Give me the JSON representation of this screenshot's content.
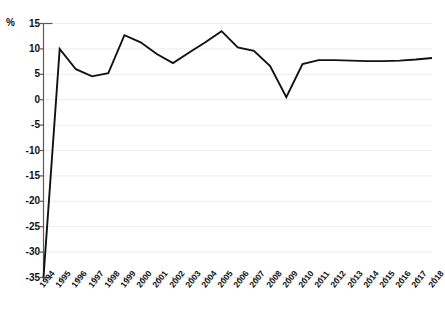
{
  "chart_data": {
    "type": "line",
    "title": "",
    "subtitle": "",
    "xlabel": "",
    "ylabel": "%",
    "unit_label": "%",
    "grid": true,
    "legend": null,
    "legend_position": "none",
    "line_color": "#111111",
    "grid_color": "#ededed",
    "axis_color": "#5a5a5a",
    "background_color": "#ffffff",
    "ylim": [
      -35,
      15
    ],
    "yticks": [
      15,
      10,
      5,
      0,
      -5,
      -10,
      -15,
      -20,
      -25,
      -30,
      -35
    ],
    "ytick_labels": [
      "15",
      "10",
      "5",
      "0",
      "-5",
      "-10",
      "-15",
      "-20",
      "-25",
      "-30",
      "-35"
    ],
    "categories": [
      "1994",
      "1995",
      "1996",
      "1997",
      "1998",
      "1999",
      "2000",
      "2001",
      "2002",
      "2003",
      "2004",
      "2005",
      "2006",
      "2007",
      "2008",
      "2009",
      "2010",
      "2011",
      "2012",
      "2013",
      "2014",
      "2015",
      "2016",
      "2017",
      "2018"
    ],
    "series": [
      {
        "name": "Annual change",
        "values": [
          -35.0,
          10.0,
          6.0,
          4.6,
          5.2,
          12.7,
          11.3,
          9.0,
          7.2,
          9.3,
          11.3,
          13.5,
          10.3,
          9.6,
          6.6,
          0.5,
          7.0,
          7.8,
          7.8,
          7.7,
          7.6,
          7.6,
          7.7,
          7.9,
          8.2
        ]
      }
    ]
  },
  "footnote": {
    "text": ""
  }
}
